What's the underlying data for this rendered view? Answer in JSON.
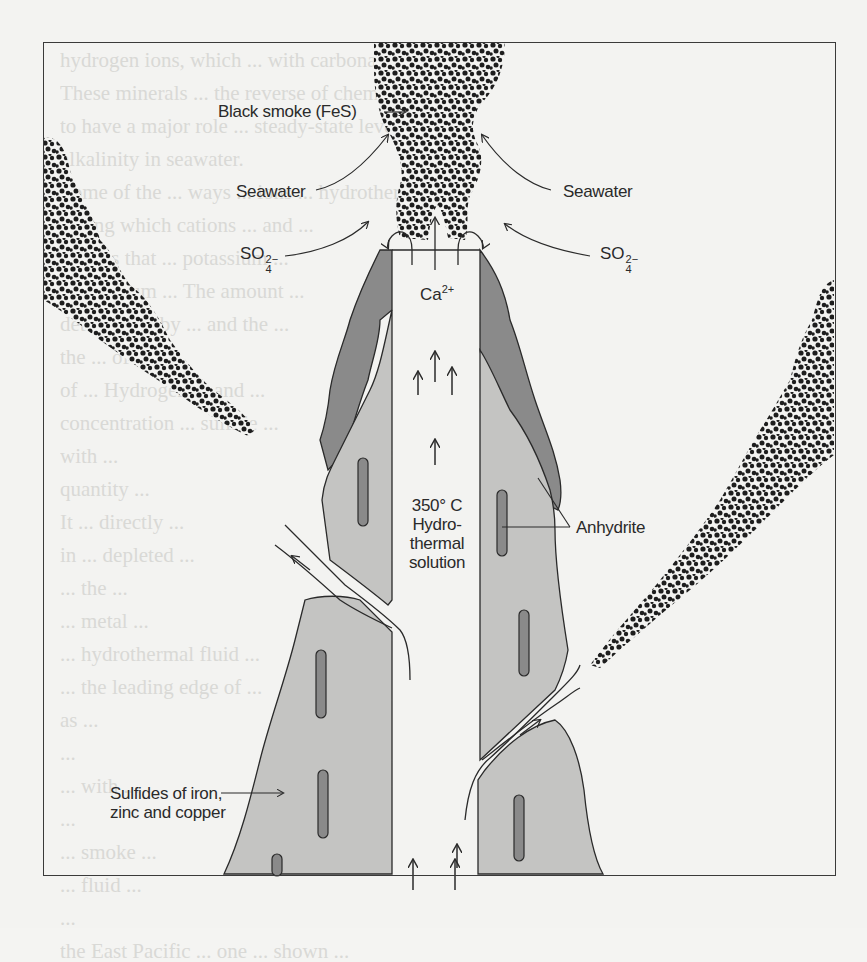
{
  "figure": {
    "labels": {
      "black_smoke": "Black smoke (FeS)",
      "seawater_left": "Seawater",
      "seawater_right": "Seawater",
      "sulfate_left": {
        "base": "SO",
        "sub": "4",
        "sup": "2−"
      },
      "sulfate_right": {
        "base": "SO",
        "sub": "4",
        "sup": "2−"
      },
      "calcium": {
        "base": "Ca",
        "sup": "2+"
      },
      "temperature": "350° C",
      "solution_line1": "Hydro-",
      "solution_line2": "thermal",
      "solution_line3": "solution",
      "anhydrite": "Anhydrite",
      "sulfides_line1": "Sulfides of iron,",
      "sulfides_line2": "zinc and copper"
    },
    "colors": {
      "frame": "#3a3a3a",
      "smoke": "#1e1e1e",
      "anhydrite_dark": "#8a8a8a",
      "sulfide_light": "#c4c4c2",
      "outline": "#2a2a2a",
      "background": "#f3f3f1"
    }
  },
  "bleed_through_text": [
    "hydrogen ions, which ... with carbonate ... ",
    "These minerals ... the reverse of chemical weather-",
    "to have a major role ... steady-state levels of",
    "alkalinity in seawater.",
    "Some of the ... ways ... ions ... hydrothermal",
    "during which cations ... and ... ",
    "cations that ... potassium ... ",
    "magnesium ... The amount ... ",
    "determined by ... and the ... ",
    "the ... of the ... ",
    "of ... Hydrogen ... and ... ",
    "concentration ... sulfide ... ",
    "with ... ",
    "quantity ... ",
    "It ... directly ... ",
    "in ... depleted ... ",
    "... the ... ",
    "... metal ... ",
    "... hydrothermal fluid ... ",
    "... the leading edge of ... ",
    "as ... ",
    "... ",
    "... with ... ",
    "... ",
    "... smoke ... ",
    "... fluid ... ",
    "... ",
    "the East Pacific ... one ... shown ..."
  ]
}
